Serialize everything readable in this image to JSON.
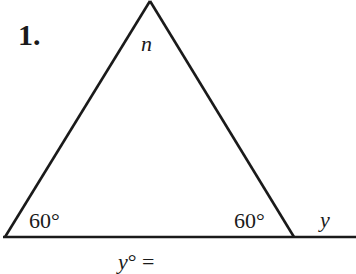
{
  "problem": {
    "number": "1.",
    "apex_label": "n",
    "left_angle": "60°",
    "right_angle": "60°",
    "exterior_label": "y",
    "answer_prompt": {
      "variable": "y",
      "suffix": "° ="
    }
  },
  "figure": {
    "type": "triangle",
    "vertices": {
      "left": [
        5,
        237
      ],
      "apex": [
        150,
        1
      ],
      "right": [
        294,
        237
      ]
    },
    "baseline_extends_to": 356,
    "stroke_color": "#1a1a1a"
  }
}
